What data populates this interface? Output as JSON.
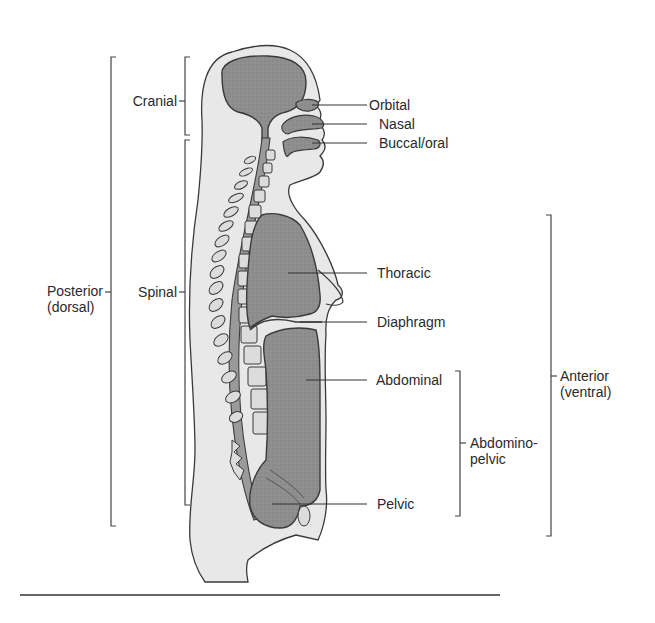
{
  "figure": {
    "colors": {
      "body_fill": "#e8e8e8",
      "organ_fill": "#8c8c8c",
      "outline": "#3a3a3a",
      "vertebra_fill": "#dcdcdc",
      "bracket": "#444444",
      "text": "#2a2a2a"
    }
  },
  "labels": {
    "cranial": "Cranial",
    "spinal": "Spinal",
    "posterior_line1": "Posterior",
    "posterior_line2": "(dorsal)",
    "orbital": "Orbital",
    "nasal": "Nasal",
    "buccal": "Buccal/oral",
    "thoracic": "Thoracic",
    "diaphragm": "Diaphragm",
    "abdominal": "Abdominal",
    "abdominopelvic_line1": "Abdomino-",
    "abdominopelvic_line2": "pelvic",
    "pelvic": "Pelvic",
    "anterior_line1": "Anterior",
    "anterior_line2": "(ventral)"
  }
}
